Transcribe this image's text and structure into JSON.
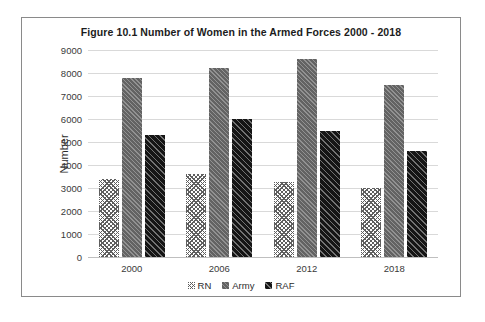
{
  "chart_data": {
    "type": "bar",
    "title": "Figure 10.1 Number of Women in the Armed Forces 2000 - 2018",
    "xlabel": "",
    "ylabel": "Number",
    "categories": [
      "2000",
      "2006",
      "2012",
      "2018"
    ],
    "series": [
      {
        "name": "RN",
        "values": [
          3400,
          3600,
          3250,
          3000
        ],
        "color": "#5f5f5f",
        "pattern": "cross-hatch"
      },
      {
        "name": "Army",
        "values": [
          7800,
          8200,
          8600,
          7500
        ],
        "color": "#636363",
        "pattern": "light-dotted"
      },
      {
        "name": "RAF",
        "values": [
          5300,
          6000,
          5500,
          4600
        ],
        "color": "#151515",
        "pattern": "dark-dotted"
      }
    ],
    "ylim": [
      0,
      9000
    ],
    "yticks": [
      0,
      1000,
      2000,
      3000,
      4000,
      5000,
      6000,
      7000,
      8000,
      9000
    ],
    "ytick_labels": [
      "0",
      "1000",
      "2000",
      "3000",
      "4000",
      "5000",
      "6000",
      "7000",
      "8000",
      "9000"
    ],
    "grid": true,
    "legend_position": "bottom"
  }
}
